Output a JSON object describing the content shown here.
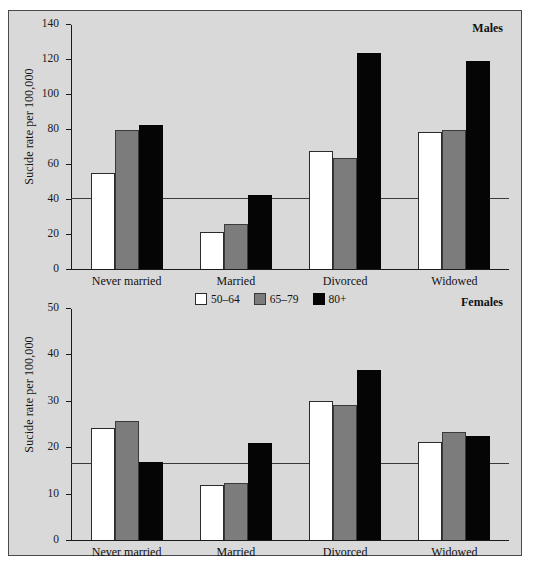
{
  "figure": {
    "background": "#d9d9d9",
    "border_color": "#4a4a4a"
  },
  "legend": {
    "position": "top-center-of-lower-panel",
    "entries": [
      {
        "label": "50–64",
        "color": "#ffffff",
        "name": "legend-50-64"
      },
      {
        "label": "65–79",
        "color": "#7c7c7c",
        "name": "legend-65-79"
      },
      {
        "label": "80+",
        "color": "#050505",
        "name": "legend-80-plus"
      }
    ]
  },
  "chart_data": [
    {
      "type": "bar",
      "panel": "males",
      "title": "Males",
      "xlabel": "",
      "ylabel": "Sucide rate per 100,000",
      "categories": [
        "Never married",
        "Married",
        "Divorced",
        "Widowed"
      ],
      "series": [
        {
          "name": "50–64",
          "color": "#ffffff",
          "values": [
            55,
            21.5,
            68,
            78.5
          ]
        },
        {
          "name": "65–79",
          "color": "#7c7c7c",
          "values": [
            79.5,
            26,
            63.5,
            80
          ]
        },
        {
          "name": "80+",
          "color": "#050505",
          "values": [
            82.5,
            42.5,
            124,
            119.5
          ]
        }
      ],
      "ylim": [
        0,
        140
      ],
      "yticks": [
        0,
        20,
        40,
        60,
        80,
        100,
        120,
        140
      ],
      "reference_line": 40.5,
      "grid": false
    },
    {
      "type": "bar",
      "panel": "females",
      "title": "Females",
      "xlabel": "",
      "ylabel": "Sucide rate per 100,000",
      "categories": [
        "Never married",
        "Married",
        "Divorced",
        "Widowed"
      ],
      "series": [
        {
          "name": "50–64",
          "color": "#ffffff",
          "values": [
            24.3,
            11.9,
            30,
            21.3
          ]
        },
        {
          "name": "65–79",
          "color": "#7c7c7c",
          "values": [
            25.7,
            12.3,
            29.2,
            23.3
          ]
        },
        {
          "name": "80+",
          "color": "#050505",
          "values": [
            16.9,
            21,
            36.7,
            22.5
          ]
        }
      ],
      "ylim": [
        0,
        50
      ],
      "yticks": [
        0,
        10,
        20,
        30,
        40,
        50
      ],
      "reference_line": 16.6,
      "grid": false
    }
  ]
}
